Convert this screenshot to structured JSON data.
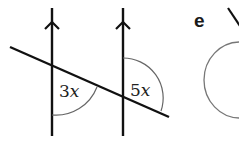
{
  "diagram": {
    "type": "parallel-lines-transversal",
    "angles": [
      {
        "label_num": "3",
        "label_var": "x",
        "position": "left intersection, below transversal, right of line"
      },
      {
        "label_num": "5",
        "label_var": "x",
        "position": "right intersection, above transversal, right of line"
      }
    ],
    "next_part_label": "e",
    "colors": {
      "line": "#111111",
      "arc": "#666666",
      "text": "#222222"
    }
  }
}
